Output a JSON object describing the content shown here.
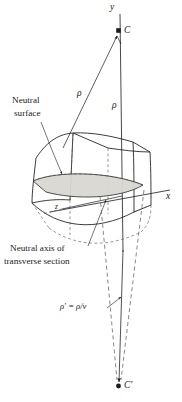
{
  "figure": {
    "background_color": "#ffffff",
    "stroke_color": "#1a1a1a",
    "dashed_color": "#555555",
    "shaded_surface_color": "#d8d6d0",
    "width": 182,
    "height": 402
  },
  "labels": {
    "axis_y": "y",
    "axis_x": "x",
    "axis_z": "z",
    "center_top": "C",
    "center_bottom": "C′",
    "rho_slant": "ρ",
    "rho_vertical": "ρ",
    "rho_prime_equation": "ρ′ = ρ/ν",
    "neutral_surface_line1": "Neutral",
    "neutral_surface_line2": "surface",
    "neutral_axis_line1": "Neutral axis of",
    "neutral_axis_line2": "transverse section"
  },
  "annotations": {
    "leader_neutral_surface": "leader-line-neutral-surface",
    "leader_neutral_axis": "leader-line-neutral-axis",
    "leader_rho_prime": "leader-line-rho-prime"
  },
  "geometry": {
    "center_top_point": [
      119,
      31
    ],
    "center_bottom_point": [
      118,
      386
    ],
    "y_axis_from": [
      120,
      14
    ],
    "y_axis_to": [
      122,
      250
    ],
    "x_axis_from": [
      52,
      210
    ],
    "x_axis_to": [
      172,
      190
    ]
  }
}
